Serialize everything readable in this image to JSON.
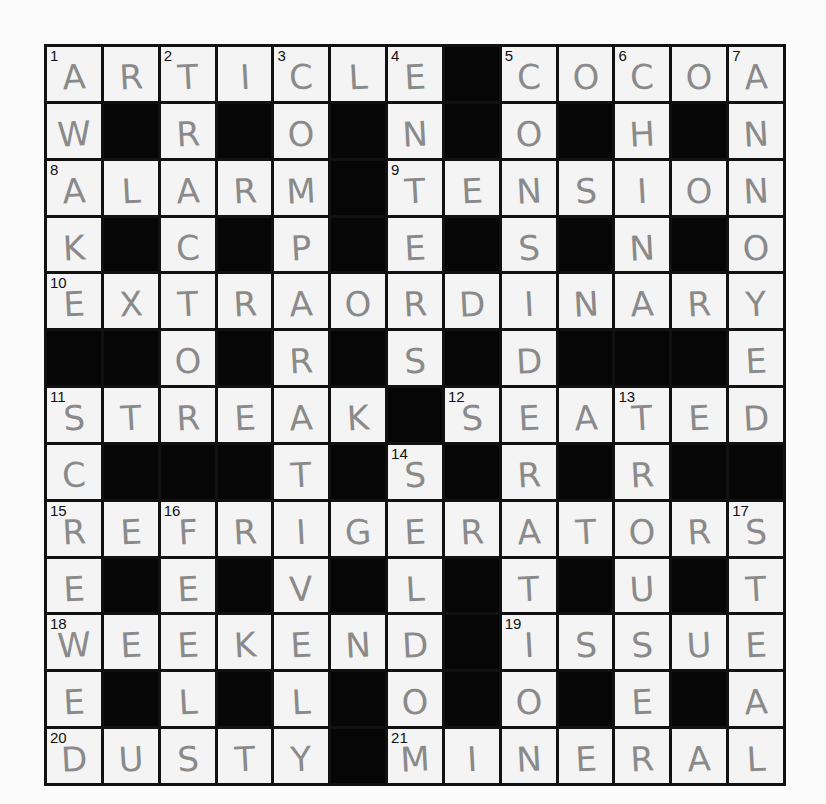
{
  "puzzle": {
    "rows": 13,
    "cols": 13,
    "colors": {
      "block": "#060606",
      "cell": "#f4f4f4",
      "pencil": "#8a8a8a",
      "border": "#111111"
    },
    "grid": [
      "ARTICLE#COCOA",
      "W#R#O#N#O#H#N",
      "ALARM#TENSION",
      "K#C#P#E#S#N#O",
      "EXTRAORDINARY",
      "##O#R#S#D###E",
      "STREAK#SEATED",
      "C###T#S#R#R##",
      "REFRIGERATORS",
      "E#E#V#L#T#U#T",
      "WEEKEND#ISSUE",
      "E#L#L#O#O#E#A",
      "DUSTY#MINERAL"
    ],
    "numbers": [
      {
        "r": 0,
        "c": 0,
        "n": "1"
      },
      {
        "r": 0,
        "c": 2,
        "n": "2"
      },
      {
        "r": 0,
        "c": 4,
        "n": "3"
      },
      {
        "r": 0,
        "c": 6,
        "n": "4"
      },
      {
        "r": 0,
        "c": 8,
        "n": "5"
      },
      {
        "r": 0,
        "c": 10,
        "n": "6"
      },
      {
        "r": 0,
        "c": 12,
        "n": "7"
      },
      {
        "r": 2,
        "c": 0,
        "n": "8"
      },
      {
        "r": 2,
        "c": 6,
        "n": "9"
      },
      {
        "r": 4,
        "c": 0,
        "n": "10"
      },
      {
        "r": 6,
        "c": 0,
        "n": "11"
      },
      {
        "r": 6,
        "c": 7,
        "n": "12"
      },
      {
        "r": 6,
        "c": 10,
        "n": "13"
      },
      {
        "r": 7,
        "c": 6,
        "n": "14"
      },
      {
        "r": 8,
        "c": 0,
        "n": "15"
      },
      {
        "r": 8,
        "c": 2,
        "n": "16"
      },
      {
        "r": 8,
        "c": 12,
        "n": "17"
      },
      {
        "r": 10,
        "c": 0,
        "n": "18"
      },
      {
        "r": 10,
        "c": 8,
        "n": "19"
      },
      {
        "r": 12,
        "c": 0,
        "n": "20"
      },
      {
        "r": 12,
        "c": 6,
        "n": "21"
      }
    ],
    "answers": {
      "across": [
        {
          "n": "1",
          "answer": "ARTICLE"
        },
        {
          "n": "5",
          "answer": "COCOA"
        },
        {
          "n": "8",
          "answer": "ALARM"
        },
        {
          "n": "9",
          "answer": "TENSION"
        },
        {
          "n": "10",
          "answer": "EXTRAORDINARY"
        },
        {
          "n": "11",
          "answer": "STREAK"
        },
        {
          "n": "12",
          "answer": "SEATED"
        },
        {
          "n": "15",
          "answer": "REFRIGERATORS"
        },
        {
          "n": "18",
          "answer": "WEEKEND"
        },
        {
          "n": "19",
          "answer": "ISSUE"
        },
        {
          "n": "20",
          "answer": "DUSTY"
        },
        {
          "n": "21",
          "answer": "MINERAL"
        }
      ],
      "down": [
        {
          "n": "1",
          "answer": "AWAKE"
        },
        {
          "n": "2",
          "answer": "TRACTOR"
        },
        {
          "n": "3",
          "answer": "COMPARATIVE"
        },
        {
          "n": "4",
          "answer": "ENTERS"
        },
        {
          "n": "5",
          "answer": "COSID"
        },
        {
          "n": "6",
          "answer": "CHIN"
        },
        {
          "n": "7",
          "answer": "ANNOYED"
        },
        {
          "n": "11",
          "answer": "SCREWED"
        },
        {
          "n": "12",
          "answer": "SERATION"
        },
        {
          "n": "13",
          "answer": "TROUSER"
        },
        {
          "n": "14",
          "answer": "SELDOM"
        },
        {
          "n": "16",
          "answer": "FEELS"
        },
        {
          "n": "17",
          "answer": "STEAL"
        }
      ]
    }
  }
}
